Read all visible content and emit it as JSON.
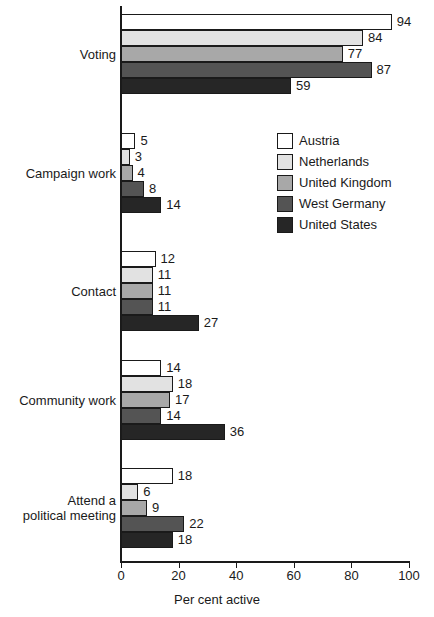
{
  "chart_data": {
    "type": "bar",
    "orientation": "horizontal",
    "title": "",
    "xlabel": "Per cent active",
    "ylabel": "",
    "xlim": [
      0,
      100
    ],
    "xticks": [
      0,
      20,
      40,
      60,
      80,
      100
    ],
    "grid": false,
    "legend_position": "upper right inside",
    "categories": [
      "Voting",
      "Campaign work",
      "Contact",
      "Community work",
      "Attend a\npolitical meeting"
    ],
    "series": [
      {
        "name": "Austria",
        "color": "#ffffff",
        "values": [
          94,
          5,
          12,
          14,
          18
        ]
      },
      {
        "name": "Netherlands",
        "color": "#e2e2e2",
        "values": [
          84,
          3,
          11,
          18,
          6
        ]
      },
      {
        "name": "United Kingdom",
        "color": "#a8a8a8",
        "values": [
          77,
          4,
          11,
          17,
          9
        ]
      },
      {
        "name": "West Germany",
        "color": "#545454",
        "values": [
          87,
          8,
          11,
          14,
          22
        ]
      },
      {
        "name": "United States",
        "color": "#262626",
        "values": [
          59,
          14,
          27,
          36,
          18
        ]
      }
    ]
  }
}
